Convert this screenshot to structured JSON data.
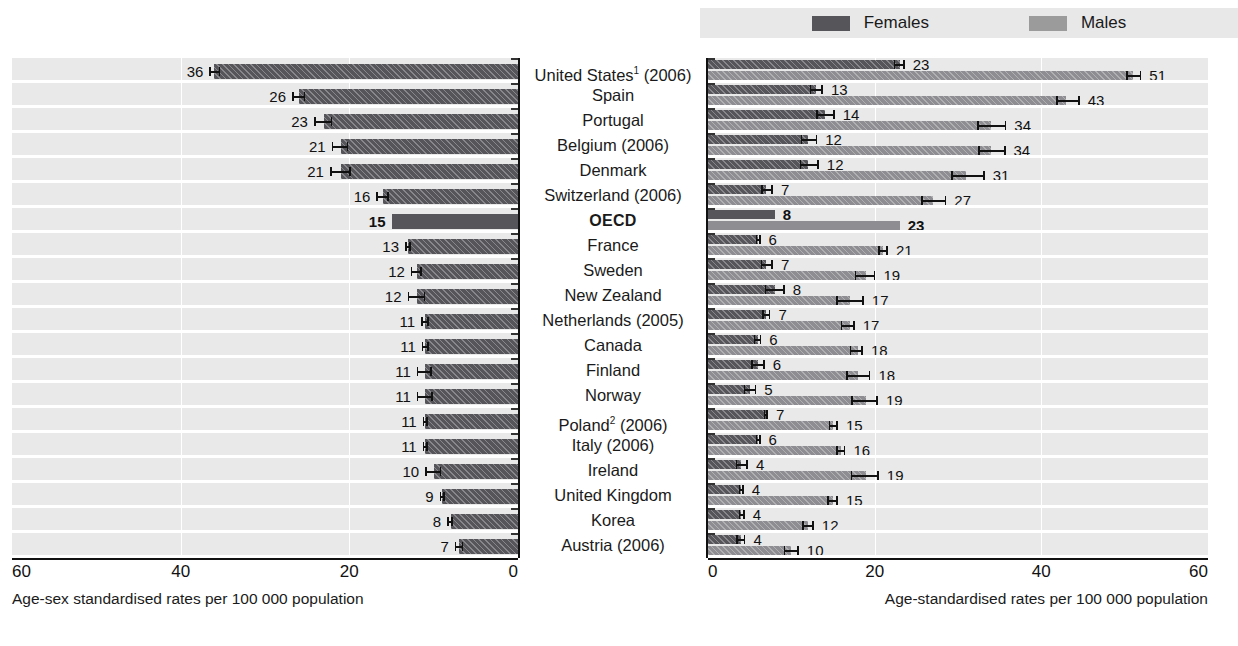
{
  "legend": {
    "items": [
      {
        "label": "Females",
        "color": "#55555a",
        "icon": "legend-swatch"
      },
      {
        "label": "Males",
        "color": "#9b9b9b",
        "icon": "legend-swatch"
      }
    ]
  },
  "axes": {
    "left": {
      "title": "Age-sex standardised rates per 100 000 population",
      "ticks": [
        "60",
        "40",
        "20",
        "0"
      ],
      "min": 0,
      "max": 60,
      "reversed": true
    },
    "right": {
      "title": "Age-standardised rates per 100 000 population",
      "ticks": [
        "0",
        "20",
        "40",
        "60"
      ],
      "min": 0,
      "max": 60,
      "reversed": false
    }
  },
  "caption": "",
  "chart_data": {
    "type": "bar",
    "orientation": "horizontal",
    "panels": [
      "total",
      "by-sex"
    ],
    "xlabel_left": "Age-sex standardised rates per 100 000 population",
    "xlabel_right": "Age-standardised rates per 100 000 population",
    "xlim": [
      0,
      60
    ],
    "grid": true,
    "legend_position": "top-right",
    "series": [
      {
        "name": "Total",
        "panel": "left",
        "color": "#55555a"
      },
      {
        "name": "Females",
        "panel": "right",
        "color": "#55555a"
      },
      {
        "name": "Males",
        "panel": "right",
        "color": "#8e8e92"
      }
    ],
    "categories": [
      "United States¹ (2006)",
      "Spain",
      "Portugal",
      "Belgium (2006)",
      "Denmark",
      "Switzerland (2006)",
      "OECD",
      "France",
      "Sweden",
      "New Zealand",
      "Netherlands (2005)",
      "Canada",
      "Finland",
      "Norway",
      "Poland² (2006)",
      "Italy (2006)",
      "Ireland",
      "United Kingdom",
      "Korea",
      "Austria (2006)"
    ],
    "rows": [
      {
        "country": "United States",
        "sup": "1",
        "year": "(2006)",
        "bold": false,
        "total": 36,
        "total_lo": 35.3,
        "total_hi": 36.6,
        "females": 23,
        "females_lo": 22.3,
        "females_hi": 23.6,
        "males": 51,
        "males_lo": 50.2,
        "males_hi": 52.0
      },
      {
        "country": "Spain",
        "sup": "",
        "year": "",
        "bold": false,
        "total": 26,
        "total_lo": 25.2,
        "total_hi": 26.8,
        "females": 13,
        "females_lo": 12.2,
        "females_hi": 13.8,
        "males": 43,
        "males_lo": 41.8,
        "males_hi": 44.6
      },
      {
        "country": "Portugal",
        "sup": "",
        "year": "",
        "bold": false,
        "total": 23,
        "total_lo": 22.0,
        "total_hi": 24.2,
        "females": 14,
        "females_lo": 13.0,
        "females_hi": 15.2,
        "males": 34,
        "males_lo": 32.3,
        "males_hi": 35.8
      },
      {
        "country": "Belgium",
        "sup": "",
        "year": "(2006)",
        "bold": false,
        "total": 21,
        "total_lo": 20.1,
        "total_hi": 22.1,
        "females": 12,
        "females_lo": 11.1,
        "females_hi": 13.1,
        "males": 34,
        "males_lo": 32.4,
        "males_hi": 35.7
      },
      {
        "country": "Denmark",
        "sup": "",
        "year": "",
        "bold": false,
        "total": 21,
        "total_lo": 19.8,
        "total_hi": 22.3,
        "females": 12,
        "females_lo": 11.0,
        "females_hi": 13.3,
        "males": 31,
        "males_lo": 29.2,
        "males_hi": 33.2
      },
      {
        "country": "Switzerland",
        "sup": "",
        "year": "(2006)",
        "bold": false,
        "total": 16,
        "total_lo": 15.3,
        "total_hi": 16.8,
        "females": 7,
        "females_lo": 6.4,
        "females_hi": 7.8,
        "males": 27,
        "males_lo": 25.6,
        "males_hi": 28.6
      },
      {
        "country": "OECD",
        "sup": "",
        "year": "",
        "bold": true,
        "total": 15,
        "total_lo": null,
        "total_hi": null,
        "females": 8,
        "females_lo": null,
        "females_hi": null,
        "males": 23,
        "males_lo": null,
        "males_hi": null
      },
      {
        "country": "France",
        "sup": "",
        "year": "",
        "bold": false,
        "total": 13,
        "total_lo": 12.7,
        "total_hi": 13.4,
        "females": 6,
        "females_lo": 5.7,
        "females_hi": 6.3,
        "males": 21,
        "males_lo": 20.4,
        "males_hi": 21.6
      },
      {
        "country": "Sweden",
        "sup": "",
        "year": "",
        "bold": false,
        "total": 12,
        "total_lo": 11.4,
        "total_hi": 12.7,
        "females": 7,
        "females_lo": 6.3,
        "females_hi": 7.8,
        "males": 19,
        "males_lo": 17.6,
        "males_hi": 20.1
      },
      {
        "country": "New Zealand",
        "sup": "",
        "year": "",
        "bold": false,
        "total": 12,
        "total_lo": 11.0,
        "total_hi": 13.1,
        "females": 8,
        "females_lo": 6.8,
        "females_hi": 9.2,
        "males": 17,
        "males_lo": 15.4,
        "males_hi": 18.7
      },
      {
        "country": "Netherlands",
        "sup": "",
        "year": "(2005)",
        "bold": false,
        "total": 11,
        "total_lo": 10.6,
        "total_hi": 11.5,
        "females": 7,
        "females_lo": 6.5,
        "females_hi": 7.5,
        "males": 17,
        "males_lo": 15.9,
        "males_hi": 17.6
      },
      {
        "country": "Canada",
        "sup": "",
        "year": "",
        "bold": false,
        "total": 11,
        "total_lo": 10.6,
        "total_hi": 11.4,
        "females": 6,
        "females_lo": 5.5,
        "females_hi": 6.4,
        "males": 18,
        "males_lo": 17.0,
        "males_hi": 18.6
      },
      {
        "country": "Finland",
        "sup": "",
        "year": "",
        "bold": false,
        "total": 11,
        "total_lo": 10.2,
        "total_hi": 12.0,
        "females": 6,
        "females_lo": 5.2,
        "females_hi": 6.8,
        "males": 18,
        "males_lo": 16.6,
        "males_hi": 19.5
      },
      {
        "country": "Norway",
        "sup": "",
        "year": "",
        "bold": false,
        "total": 11,
        "total_lo": 10.1,
        "total_hi": 12.0,
        "females": 5,
        "females_lo": 4.3,
        "females_hi": 5.8,
        "males": 19,
        "males_lo": 17.2,
        "males_hi": 20.4
      },
      {
        "country": "Poland",
        "sup": "2",
        "year": "(2006)",
        "bold": false,
        "total": 11,
        "total_lo": 10.7,
        "total_hi": 11.3,
        "females": 7,
        "females_lo": 6.7,
        "females_hi": 7.2,
        "males": 15,
        "males_lo": 14.5,
        "males_hi": 15.6
      },
      {
        "country": "Italy",
        "sup": "",
        "year": "(2006)",
        "bold": false,
        "total": 11,
        "total_lo": 10.7,
        "total_hi": 11.3,
        "females": 6,
        "females_lo": 5.7,
        "females_hi": 6.3,
        "males": 16,
        "males_lo": 15.4,
        "males_hi": 16.5
      },
      {
        "country": "Ireland",
        "sup": "",
        "year": "",
        "bold": false,
        "total": 10,
        "total_lo": 9.1,
        "total_hi": 11.0,
        "females": 4,
        "females_lo": 3.3,
        "females_hi": 4.8,
        "males": 19,
        "males_lo": 17.1,
        "males_hi": 20.5
      },
      {
        "country": "United Kingdom",
        "sup": "",
        "year": "",
        "bold": false,
        "total": 9,
        "total_lo": 8.7,
        "total_hi": 9.3,
        "females": 4,
        "females_lo": 3.7,
        "females_hi": 4.3,
        "males": 15,
        "males_lo": 14.3,
        "males_hi": 15.6
      },
      {
        "country": "Korea",
        "sup": "",
        "year": "",
        "bold": false,
        "total": 8,
        "total_lo": 7.7,
        "total_hi": 8.4,
        "females": 4,
        "females_lo": 3.7,
        "females_hi": 4.4,
        "males": 12,
        "males_lo": 11.3,
        "males_hi": 12.7
      },
      {
        "country": "Austria",
        "sup": "",
        "year": "(2006)",
        "bold": false,
        "total": 7,
        "total_lo": 6.5,
        "total_hi": 7.5,
        "females": 4,
        "females_lo": 3.4,
        "females_hi": 4.5,
        "males": 10,
        "males_lo": 9.1,
        "males_hi": 10.9
      }
    ]
  }
}
